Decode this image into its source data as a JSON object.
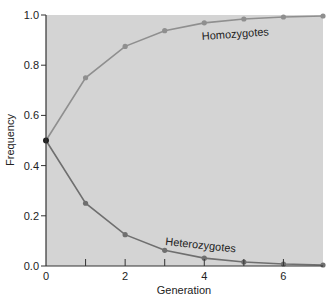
{
  "chart_data": {
    "type": "line",
    "title": "",
    "xlabel": "Generation",
    "ylabel": "Frequency",
    "x": [
      0,
      1,
      2,
      3,
      4,
      5,
      6,
      7
    ],
    "xlim": [
      0,
      7
    ],
    "ylim": [
      0,
      1.0
    ],
    "x_ticks": [
      "0",
      "2",
      "4",
      "6"
    ],
    "x_tick_marks": [
      1,
      2,
      3,
      4,
      5,
      6
    ],
    "y_ticks": [
      "0.0",
      "0.2",
      "0.4",
      "0.6",
      "0.8",
      "1.0"
    ],
    "grid": false,
    "legend": "inline labels",
    "series": [
      {
        "name": "Homozygotes",
        "values": [
          0.5,
          0.75,
          0.875,
          0.9375,
          0.96875,
          0.984,
          0.992,
          0.996
        ]
      },
      {
        "name": "Heterozygotes",
        "values": [
          0.5,
          0.25,
          0.125,
          0.0625,
          0.03125,
          0.016,
          0.008,
          0.004
        ]
      }
    ],
    "colors": {
      "plot_background": "#d4d4d4",
      "homozygote_line": "#8f8f8f",
      "heterozygote_line": "#6f6f6f",
      "axis": "#333333"
    }
  }
}
